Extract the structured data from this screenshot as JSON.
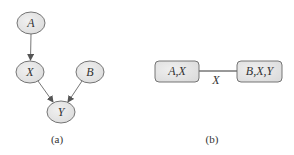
{
  "figure_a": {
    "caption": "(a)",
    "nodes": [
      {
        "id": "A",
        "label": "A",
        "cx": 31,
        "cy": 23
      },
      {
        "id": "X",
        "label": "X",
        "cx": 30,
        "cy": 72
      },
      {
        "id": "B",
        "label": "B",
        "cx": 90,
        "cy": 72
      },
      {
        "id": "Y",
        "label": "Y",
        "cx": 61,
        "cy": 112
      }
    ],
    "edges": [
      {
        "from": "A",
        "to": "X"
      },
      {
        "from": "X",
        "to": "Y"
      },
      {
        "from": "B",
        "to": "Y"
      }
    ]
  },
  "figure_b": {
    "caption": "(b)",
    "cliques": [
      {
        "id": "c1",
        "label": "A,X"
      },
      {
        "id": "c2",
        "label": "B,X,Y"
      }
    ],
    "separator": {
      "label": "X"
    }
  },
  "colors": {
    "node_fill": "#e4e4e4",
    "stroke": "#555555",
    "text": "#333333"
  }
}
